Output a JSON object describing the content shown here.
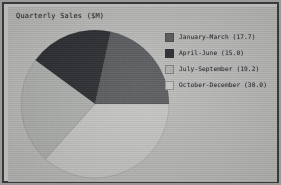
{
  "window": {
    "frame_color": "#39393a",
    "canvas_color": "#bcbcba"
  },
  "chart_data": {
    "type": "pie",
    "title": "Quarterly Sales ($M)",
    "xlabel": "",
    "ylabel": "",
    "legend_position": "right",
    "grid": false,
    "startangle": 0,
    "direction": "counterclockwise",
    "categories": [
      "January-March",
      "April-June",
      "July-September",
      "October-December"
    ],
    "values": [
      17.7,
      15.0,
      19.2,
      30.0
    ],
    "legend_entries": [
      "January-March (17.7)",
      "April-June (15.0)",
      "July-September (19.2)",
      "October-December (30.0)"
    ],
    "colors": [
      "#595b5e",
      "#2a2c30",
      "#b0b2b0",
      "#c8c9c6"
    ]
  },
  "legend": {
    "rows": [
      {
        "label": "January-March (17.7)",
        "color": "#595b5e"
      },
      {
        "label": "April-June (15.0)",
        "color": "#2a2c30"
      },
      {
        "label": "July-September (19.2)",
        "color": "#b0b2b0"
      },
      {
        "label": "October-December (30.0)",
        "color": "#c8c9c6"
      }
    ]
  }
}
